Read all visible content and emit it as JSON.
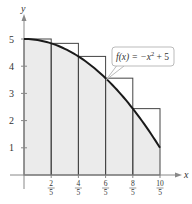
{
  "chart_data": {
    "type": "area",
    "title": "",
    "function_label": "f(x) = −x² + 5",
    "function_label_parts": {
      "lhs": "f(x) = −x",
      "exp": "2",
      "rhs": " + 5"
    },
    "xlabel": "x",
    "ylabel": "y",
    "xlim": [
      0,
      2.15
    ],
    "ylim": [
      0,
      5.6
    ],
    "grid": false,
    "y_ticks": [
      {
        "value": 1,
        "label": "1"
      },
      {
        "value": 2,
        "label": "2"
      },
      {
        "value": 3,
        "label": "3"
      },
      {
        "value": 4,
        "label": "4"
      },
      {
        "value": 5,
        "label": "5"
      }
    ],
    "x_ticks": [
      {
        "value": 0.4,
        "num": "2",
        "den": "5"
      },
      {
        "value": 0.8,
        "num": "4",
        "den": "5"
      },
      {
        "value": 1.2,
        "num": "6",
        "den": "5"
      },
      {
        "value": 1.6,
        "num": "8",
        "den": "5"
      },
      {
        "value": 2.0,
        "num": "10",
        "den": "5"
      }
    ],
    "curve": {
      "equation": "-x^2 + 5",
      "domain": [
        0,
        2
      ]
    },
    "rectangles": [
      {
        "x0": 0.0,
        "x1": 0.4,
        "height": 5.0
      },
      {
        "x0": 0.4,
        "x1": 0.8,
        "height": 4.84
      },
      {
        "x0": 0.8,
        "x1": 1.2,
        "height": 4.36
      },
      {
        "x0": 1.2,
        "x1": 1.6,
        "height": 3.56
      },
      {
        "x0": 1.6,
        "x1": 2.0,
        "height": 2.44
      }
    ],
    "shaded_region": "area under curve from x=0 to x=2",
    "colors": {
      "shade": "#ebebeb",
      "curve": "#1a1a1a",
      "rect": "#444444",
      "axis": "#777777"
    }
  }
}
